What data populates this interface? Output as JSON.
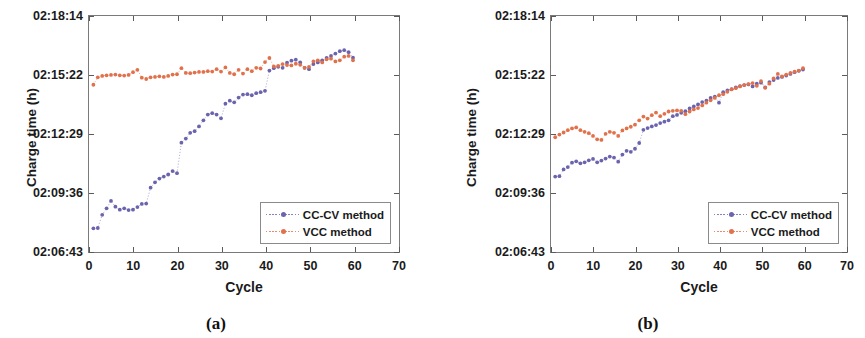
{
  "figure": {
    "caption_a": "(a)",
    "caption_b": "(b)"
  },
  "axes": {
    "ylabel": "Charge time (h)",
    "xlabel": "Cycle",
    "yticks": [
      "02:06:43",
      "02:09:36",
      "02:12:29",
      "02:15:22",
      "02:18:14"
    ],
    "ytick_values": [
      0,
      1,
      2,
      3,
      4
    ],
    "xticks": [
      "0",
      "10",
      "20",
      "30",
      "40",
      "50",
      "60",
      "70"
    ],
    "xtick_values": [
      0,
      10,
      20,
      30,
      40,
      50,
      60,
      70
    ]
  },
  "legend": {
    "items": [
      {
        "label": "CC-CV method",
        "color": "#6a63ad",
        "marker": "dot"
      },
      {
        "label": "VCC method",
        "color": "#e1714a",
        "marker": "dot"
      }
    ]
  },
  "colors": {
    "ccv": "#6a63ad",
    "vcc": "#e1714a",
    "axis": "#7a7a7a",
    "text": "#1a1a1a",
    "background": "#ffffff"
  },
  "chart_data": [
    {
      "panel": "(a)",
      "type": "scatter",
      "title": "",
      "xlabel": "Cycle",
      "ylabel": "Charge time (h)",
      "xlim": [
        0,
        70
      ],
      "ylim_labels": [
        "02:06:43",
        "02:18:14"
      ],
      "ylim_seconds": [
        7603,
        8294
      ],
      "ytick_seconds": [
        7603,
        7776,
        7949,
        8122,
        8294
      ],
      "grid": false,
      "legend_position": "lower-right",
      "series": [
        {
          "name": "CC-CV method",
          "color": "#6a63ad",
          "x": [
            1,
            2,
            3,
            4,
            5,
            6,
            7,
            8,
            9,
            10,
            11,
            12,
            13,
            14,
            15,
            16,
            17,
            18,
            19,
            20,
            21,
            22,
            23,
            24,
            25,
            26,
            27,
            28,
            29,
            30,
            31,
            32,
            33,
            34,
            35,
            36,
            37,
            38,
            39,
            40,
            41,
            42,
            43,
            44,
            45,
            46,
            47,
            48,
            49,
            50,
            51,
            52,
            53,
            54,
            55,
            56,
            57,
            58,
            59,
            60
          ],
          "y_seconds": [
            7667,
            7668,
            7707,
            7726,
            7748,
            7731,
            7722,
            7726,
            7721,
            7722,
            7730,
            7739,
            7740,
            7787,
            7803,
            7814,
            7820,
            7826,
            7836,
            7830,
            7920,
            7932,
            7949,
            7954,
            7968,
            7986,
            8003,
            8007,
            8003,
            7992,
            8035,
            8044,
            8039,
            8053,
            8062,
            8063,
            8060,
            8066,
            8069,
            8073,
            8133,
            8140,
            8144,
            8141,
            8156,
            8162,
            8165,
            8157,
            8141,
            8137,
            8152,
            8157,
            8163,
            8170,
            8176,
            8183,
            8190,
            8193,
            8187,
            8171
          ],
          "y_labels_sample": [
            "02:07:47",
            "02:09:30",
            "02:11:09",
            "02:12:53",
            "02:13:35",
            "02:13:51"
          ]
        },
        {
          "name": "VCC method",
          "color": "#e1714a",
          "x": [
            1,
            2,
            3,
            4,
            5,
            6,
            7,
            8,
            9,
            10,
            11,
            12,
            13,
            14,
            15,
            16,
            17,
            18,
            19,
            20,
            21,
            22,
            23,
            24,
            25,
            26,
            27,
            28,
            29,
            30,
            31,
            32,
            33,
            34,
            35,
            36,
            37,
            38,
            39,
            40,
            41,
            42,
            43,
            44,
            45,
            46,
            47,
            48,
            49,
            50,
            51,
            52,
            53,
            54,
            55,
            56,
            57,
            58,
            59,
            60
          ],
          "y_seconds": [
            8091,
            8113,
            8117,
            8119,
            8120,
            8121,
            8119,
            8118,
            8120,
            8128,
            8135,
            8112,
            8108,
            8113,
            8114,
            8116,
            8114,
            8117,
            8121,
            8122,
            8140,
            8126,
            8125,
            8127,
            8129,
            8129,
            8131,
            8130,
            8137,
            8130,
            8142,
            8126,
            8122,
            8135,
            8124,
            8137,
            8131,
            8141,
            8139,
            8158,
            8170,
            8145,
            8147,
            8152,
            8149,
            8148,
            8153,
            8150,
            8141,
            8144,
            8160,
            8163,
            8157,
            8166,
            8168,
            8160,
            8163,
            8174,
            8176,
            8163
          ],
          "y_labels_sample": [
            "02:14:51",
            "02:15:20",
            "02:15:30",
            "02:15:58",
            "02:16:10"
          ]
        }
      ]
    },
    {
      "panel": "(b)",
      "type": "scatter",
      "title": "",
      "xlabel": "Cycle",
      "ylabel": "Charge time (h)",
      "xlim": [
        0,
        70
      ],
      "ylim_labels": [
        "02:06:43",
        "02:18:14"
      ],
      "ylim_seconds": [
        7603,
        8294
      ],
      "ytick_seconds": [
        7603,
        7776,
        7949,
        8122,
        8294
      ],
      "grid": false,
      "legend_position": "lower-right",
      "series": [
        {
          "name": "CC-CV method",
          "color": "#6a63ad",
          "x": [
            1,
            2,
            3,
            4,
            5,
            6,
            7,
            8,
            9,
            10,
            11,
            12,
            13,
            14,
            15,
            16,
            17,
            18,
            19,
            20,
            21,
            22,
            23,
            24,
            25,
            26,
            27,
            28,
            29,
            30,
            31,
            32,
            33,
            34,
            35,
            36,
            37,
            38,
            39,
            40,
            41,
            42,
            43,
            44,
            45,
            46,
            47,
            48,
            49,
            50,
            51,
            52,
            53,
            54,
            55,
            56,
            57,
            58,
            59,
            60
          ],
          "y_seconds": [
            7820,
            7821,
            7841,
            7848,
            7861,
            7865,
            7859,
            7862,
            7868,
            7872,
            7862,
            7867,
            7873,
            7879,
            7876,
            7864,
            7885,
            7896,
            7893,
            7902,
            7919,
            7958,
            7963,
            7968,
            7972,
            7978,
            7982,
            7986,
            7998,
            8002,
            8008,
            8013,
            8021,
            8027,
            8033,
            8040,
            8044,
            8052,
            8056,
            8038,
            8069,
            8074,
            8078,
            8083,
            8087,
            8090,
            8092,
            8086,
            8094,
            8097,
            8083,
            8099,
            8105,
            8111,
            8114,
            8118,
            8123,
            8128,
            8132,
            8136
          ],
          "y_labels_sample": [
            "02:10:20",
            "02:11:59",
            "02:12:50",
            "02:13:40"
          ]
        },
        {
          "name": "VCC method",
          "color": "#e1714a",
          "x": [
            1,
            2,
            3,
            4,
            5,
            6,
            7,
            8,
            9,
            10,
            11,
            12,
            13,
            14,
            15,
            16,
            17,
            18,
            19,
            20,
            21,
            22,
            23,
            24,
            25,
            26,
            27,
            28,
            29,
            30,
            31,
            32,
            33,
            34,
            35,
            36,
            37,
            38,
            39,
            40,
            41,
            42,
            43,
            44,
            45,
            46,
            47,
            48,
            49,
            50,
            51,
            52,
            53,
            54,
            55,
            56,
            57,
            58,
            59,
            60
          ],
          "y_seconds": [
            7936,
            7944,
            7950,
            7957,
            7962,
            7965,
            7957,
            7952,
            7948,
            7940,
            7930,
            7928,
            7946,
            7952,
            7949,
            7940,
            7956,
            7962,
            7967,
            7973,
            7986,
            7997,
            7991,
            8001,
            8009,
            7998,
            8005,
            8012,
            8014,
            8015,
            8014,
            8004,
            8012,
            8018,
            8022,
            8030,
            8038,
            8045,
            8052,
            8060,
            8063,
            8070,
            8077,
            8081,
            8086,
            8090,
            8093,
            8096,
            8088,
            8102,
            8082,
            8094,
            8110,
            8123,
            8116,
            8121,
            8126,
            8130,
            8133,
            8140
          ],
          "y_labels_sample": [
            "02:12:16",
            "02:13:06",
            "02:13:20",
            "02:13:40"
          ]
        }
      ]
    }
  ]
}
